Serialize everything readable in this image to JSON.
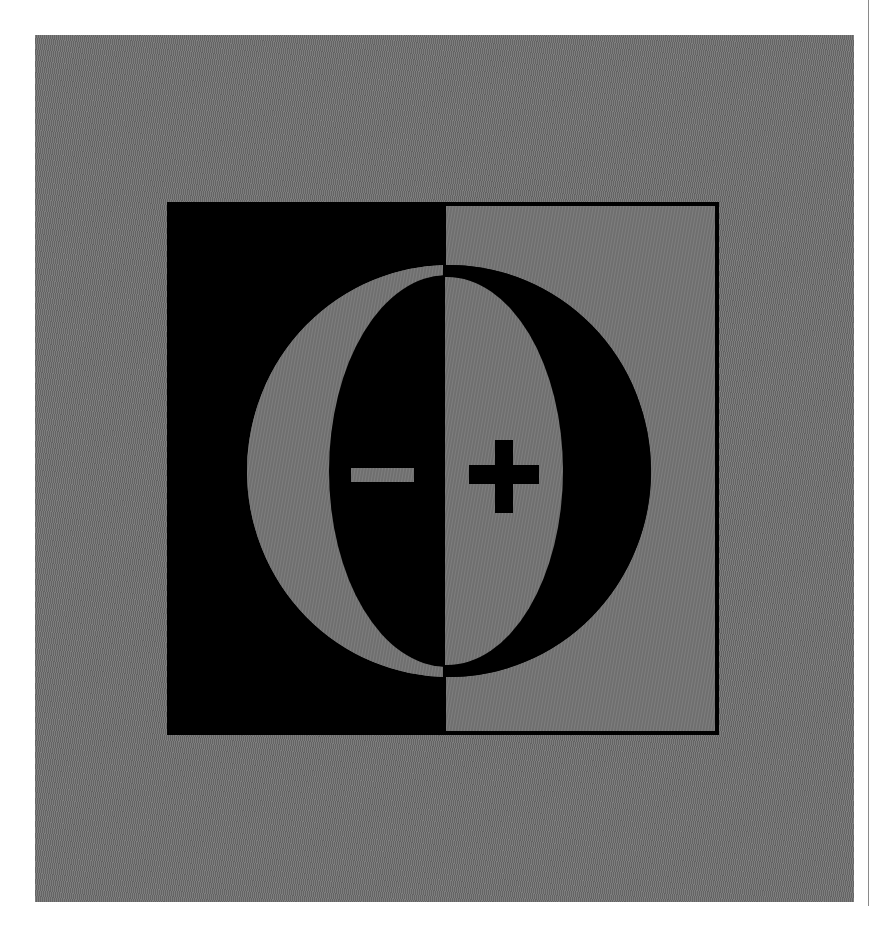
{
  "figure": {
    "symbols": {
      "negative": "−",
      "positive": "+"
    },
    "colors": {
      "background": "#ffffff",
      "panel": "#6f6f6f",
      "ink": "#000000"
    }
  }
}
